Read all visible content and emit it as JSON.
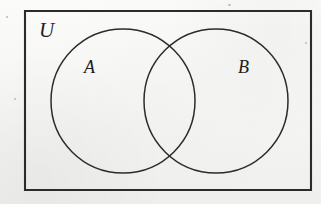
{
  "figure": {
    "type": "venn-diagram",
    "background_color": "#f7f7f5",
    "stroke_color": "#2b2b29",
    "label_color": "#20201e"
  },
  "universe": {
    "label": "U",
    "shape": "rectangle",
    "x": 25,
    "y": 11,
    "width": 286,
    "height": 179,
    "label_x": 47,
    "label_y": 31
  },
  "sets": [
    {
      "label": "A",
      "shape": "circle",
      "cx": 123,
      "cy": 101,
      "r": 72,
      "label_x": 91,
      "label_y": 69
    },
    {
      "label": "B",
      "shape": "circle",
      "cx": 216,
      "cy": 101,
      "r": 72,
      "label_x": 245,
      "label_y": 69
    }
  ],
  "intersections": [
    {
      "x": 170,
      "y": 43
    },
    {
      "x": 170,
      "y": 158
    }
  ],
  "artifacts": [
    {
      "name": "scan-speck-top",
      "x": 228,
      "y": 4,
      "size": 3
    },
    {
      "name": "scan-speck-left",
      "x": 6,
      "y": 16,
      "size": 2
    },
    {
      "name": "scan-speck-lower-left",
      "x": 14,
      "y": 98,
      "size": 2
    },
    {
      "name": "scan-speck-right",
      "x": 305,
      "y": 42,
      "size": 2
    }
  ]
}
